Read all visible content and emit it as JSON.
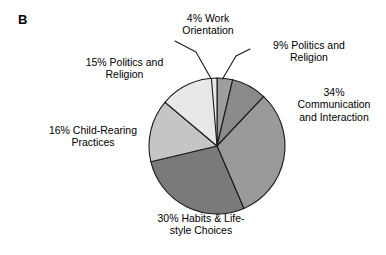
{
  "panel": {
    "label": "B"
  },
  "chart_data": {
    "type": "pie",
    "title": "",
    "center": {
      "x": 217,
      "y": 146
    },
    "radius": 68,
    "start_angle_deg": 0,
    "direction": "clockwise",
    "total_labeled_percent": 108,
    "legend": "none",
    "grid": false,
    "slices": [
      {
        "label": "4% Work Orientation",
        "category": "Work Orientation",
        "value": 4,
        "unit": "%",
        "color": "#9e9e9e",
        "label_lines": "4% Work\nOrientation",
        "leader_line": true
      },
      {
        "label": "9% Politics and Religion",
        "category": "Politics and Religion",
        "value": 9,
        "unit": "%",
        "color": "#8a8a8a",
        "label_lines": "9% Politics and\nReligion",
        "leader_line": true
      },
      {
        "label": "34% Communication and Interaction",
        "category": "Communication and Interaction",
        "value": 34,
        "unit": "%",
        "color": "#9a9a9a",
        "label_lines": "34%\nCommunication\nand Interaction",
        "leader_line": false
      },
      {
        "label": "30% Habits & Lifestyle Choices",
        "category": "Habits & Lifestyle Choices",
        "value": 30,
        "unit": "%",
        "color": "#7a7a7a",
        "label_lines": "30% Habits & Life-\nstyle Choices",
        "leader_line": false
      },
      {
        "label": "16% Child-Rearing Practices",
        "category": "Child-Rearing Practices",
        "value": 16,
        "unit": "%",
        "color": "#c5c5c5",
        "label_lines": "16% Child-Rearing\nPractices",
        "leader_line": false
      },
      {
        "label": "15% Politics and Religion",
        "category": "Politics and Religion",
        "value": 15,
        "unit": "%",
        "color": "#e8e8e8",
        "label_lines": "15% Politics and\nReligion",
        "leader_line": false
      }
    ],
    "colors": {
      "outline": "#1a1a1a",
      "background": "#ffffff",
      "text": "#000000"
    }
  }
}
